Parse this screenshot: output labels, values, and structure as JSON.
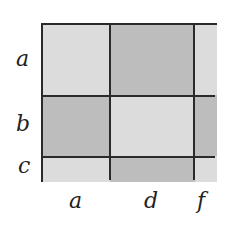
{
  "diagram": {
    "row_labels": [
      "a",
      "b",
      "c"
    ],
    "col_labels": [
      "a",
      "d",
      "f"
    ],
    "colors": {
      "light": "#dcdcdc",
      "dark": "#bdbdbd",
      "lines": "#2a2a2a"
    },
    "cells": [
      [
        "light",
        "dark",
        "light"
      ],
      [
        "dark",
        "light",
        "dark"
      ],
      [
        "light",
        "dark",
        "light"
      ]
    ]
  }
}
